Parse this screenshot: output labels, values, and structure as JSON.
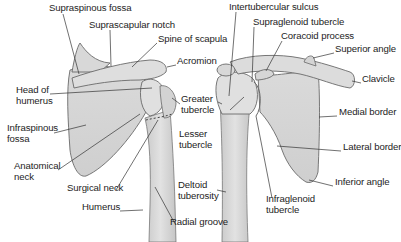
{
  "figure": {
    "views": [
      {
        "name": "posterior-view",
        "labels": [
          {
            "id": "supraspinous-fossa",
            "lines": [
              "Supraspinous fossa"
            ],
            "x": 49,
            "y": 7
          },
          {
            "id": "suprascapular-notch",
            "lines": [
              "Suprascapular notch"
            ],
            "x": 89,
            "y": 24
          },
          {
            "id": "spine-of-scapula",
            "lines": [
              "Spine of scapula"
            ],
            "x": 158,
            "y": 38
          },
          {
            "id": "acromion",
            "lines": [
              "Acromion"
            ],
            "x": 177,
            "y": 60
          },
          {
            "id": "head-of-humerus",
            "lines": [
              "Head of",
              "humerus"
            ],
            "x": 16,
            "y": 89
          },
          {
            "id": "greater-tubercle",
            "lines": [
              "Greater",
              "tubercle"
            ],
            "x": 181,
            "y": 98
          },
          {
            "id": "infraspinous-fossa",
            "lines": [
              "Infraspinous",
              "fossa"
            ],
            "x": 7,
            "y": 127
          },
          {
            "id": "lesser-tubercle",
            "lines": [
              "Lesser",
              "tubercle"
            ],
            "x": 179,
            "y": 133
          },
          {
            "id": "anatomical-neck",
            "lines": [
              "Anatomical",
              "neck"
            ],
            "x": 14,
            "y": 165
          },
          {
            "id": "surgical-neck",
            "lines": [
              "Surgical neck"
            ],
            "x": 67,
            "y": 187
          },
          {
            "id": "deltoid-tuberosity",
            "lines": [
              "Deltoid",
              "tuberosity"
            ],
            "x": 178,
            "y": 184
          },
          {
            "id": "humerus",
            "lines": [
              "Humerus"
            ],
            "x": 82,
            "y": 206
          },
          {
            "id": "radial-groove",
            "lines": [
              "Radial groove"
            ],
            "x": 170,
            "y": 221
          }
        ]
      },
      {
        "name": "anterior-view",
        "labels": [
          {
            "id": "intertubercular-sulcus",
            "lines": [
              "Intertubercular sulcus"
            ],
            "x": 229,
            "y": 6
          },
          {
            "id": "supraglenoid-tubercle",
            "lines": [
              "Supraglenoid tubercle"
            ],
            "x": 253,
            "y": 21
          },
          {
            "id": "coracoid-process",
            "lines": [
              "Coracoid process"
            ],
            "x": 281,
            "y": 35
          },
          {
            "id": "superior-angle",
            "lines": [
              "Superior angle"
            ],
            "x": 335,
            "y": 48
          },
          {
            "id": "clavicle",
            "lines": [
              "Clavicle"
            ],
            "x": 362,
            "y": 78
          },
          {
            "id": "medial-border",
            "lines": [
              "Medial border"
            ],
            "x": 339,
            "y": 111
          },
          {
            "id": "lateral-border",
            "lines": [
              "Lateral border"
            ],
            "x": 343,
            "y": 146
          },
          {
            "id": "inferior-angle",
            "lines": [
              "Inferior angle"
            ],
            "x": 335,
            "y": 181
          },
          {
            "id": "infraglenoid-tubercle",
            "lines": [
              "Infraglenoid",
              "tubercle"
            ],
            "x": 266,
            "y": 198
          }
        ]
      }
    ],
    "colors": {
      "bone_fill": "#d4d4d4",
      "bone_light": "#e4e4e4",
      "bone_outline": "#6a6a6a",
      "leader_line": "#333333",
      "label_text": "#1d1d1d",
      "background": "#ffffff"
    }
  }
}
